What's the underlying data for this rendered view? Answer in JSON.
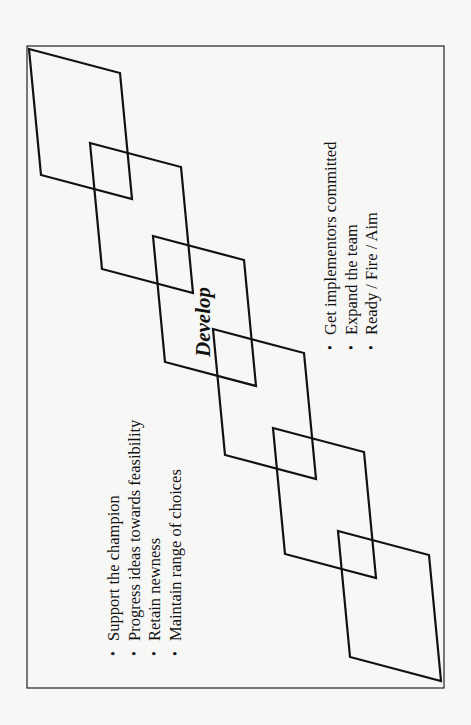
{
  "diagram": {
    "orientation": "rotated 90° counter-clockwise",
    "stage_label": "Develop",
    "shape_count": 6,
    "shape_type": "overlapping parallelograms in a diagonal chain",
    "left_bullets": [
      "Support the champion",
      "Progress ideas towards feasibility",
      "Retain newness",
      "Maintain range of choices"
    ],
    "right_bullets": [
      "Get implementors committed",
      "Expand the team",
      "Ready / Fire / Aim"
    ],
    "bullet_glyph": "•",
    "colors": {
      "background": "#f7f7f5",
      "line": "#111111",
      "text": "#111111"
    }
  }
}
